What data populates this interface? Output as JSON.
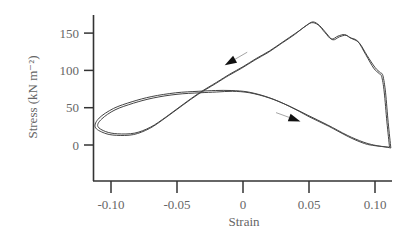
{
  "chart_data": {
    "type": "line",
    "title": "",
    "xlabel": "Strain",
    "ylabel": "Stress (kN m⁻²)",
    "xlim": [
      -0.115,
      0.115
    ],
    "ylim": [
      -48,
      173
    ],
    "x_ticks": [
      -0.1,
      -0.05,
      0,
      0.05,
      0.1
    ],
    "x_tick_labels": [
      "-0.10",
      "-0.05",
      "0",
      "0.05",
      "0.10"
    ],
    "y_ticks": [
      0,
      50,
      100,
      150
    ],
    "y_tick_labels": [
      "0",
      "50",
      "100",
      "150"
    ],
    "grid": false,
    "legend": null,
    "annotations": [
      {
        "type": "arrow",
        "direction": "down-left",
        "x": -0.006,
        "y": 115,
        "note": "unloading path direction"
      },
      {
        "type": "arrow",
        "direction": "down-right",
        "x": 0.035,
        "y": 37,
        "note": "loading path direction"
      }
    ],
    "series": [
      {
        "name": "hysteresis loop (cycle 1)",
        "x": [
          0.112,
          0.11,
          0.108,
          0.106,
          0.104,
          0.1,
          0.094,
          0.088,
          0.082,
          0.078,
          0.073,
          0.068,
          0.063,
          0.058,
          0.053,
          0.048,
          0.04,
          0.03,
          0.02,
          0.01,
          0.0,
          -0.01,
          -0.02,
          -0.033,
          -0.045,
          -0.058,
          -0.07,
          -0.082,
          -0.095,
          -0.104,
          -0.11,
          -0.107,
          -0.097,
          -0.083,
          -0.068,
          -0.05,
          -0.033,
          -0.02,
          -0.008,
          0.005,
          0.02,
          0.035,
          0.05,
          0.065,
          0.08,
          0.092,
          0.1,
          0.106,
          0.112
        ],
        "y": [
          -4,
          30,
          70,
          93,
          97,
          104,
          120,
          137,
          143,
          147,
          145,
          141,
          150,
          160,
          165,
          160,
          150,
          138,
          126,
          116,
          105,
          95,
          84,
          70,
          55,
          38,
          24,
          16,
          15,
          18,
          25,
          35,
          47,
          56,
          63,
          68,
          70,
          71,
          72,
          70,
          63,
          52,
          38,
          25,
          11,
          2,
          -1,
          -2,
          -4
        ]
      },
      {
        "name": "hysteresis loop (cycle 2)",
        "x": [
          0.111,
          0.109,
          0.107,
          0.105,
          0.103,
          0.099,
          0.093,
          0.087,
          0.081,
          0.077,
          0.072,
          0.067,
          0.062,
          0.057,
          0.052,
          0.047,
          0.039,
          0.029,
          0.019,
          0.009,
          -0.001,
          -0.011,
          -0.021,
          -0.034,
          -0.046,
          -0.059,
          -0.071,
          -0.083,
          -0.096,
          -0.105,
          -0.112,
          -0.109,
          -0.098,
          -0.084,
          -0.069,
          -0.051,
          -0.034,
          -0.021,
          -0.009,
          0.004,
          0.019,
          0.034,
          0.049,
          0.064,
          0.079,
          0.091,
          0.099,
          0.105,
          0.111
        ],
        "y": [
          -3,
          31,
          71,
          92,
          96,
          103,
          121,
          139,
          144,
          148,
          146,
          142,
          151,
          161,
          164,
          159,
          148,
          136,
          124,
          114,
          103,
          93,
          82,
          68,
          53,
          36,
          22,
          14,
          13,
          16,
          24,
          36,
          49,
          58,
          65,
          70,
          72,
          73,
          73,
          71,
          64,
          53,
          40,
          27,
          13,
          4,
          0,
          -2,
          -3
        ]
      }
    ]
  }
}
